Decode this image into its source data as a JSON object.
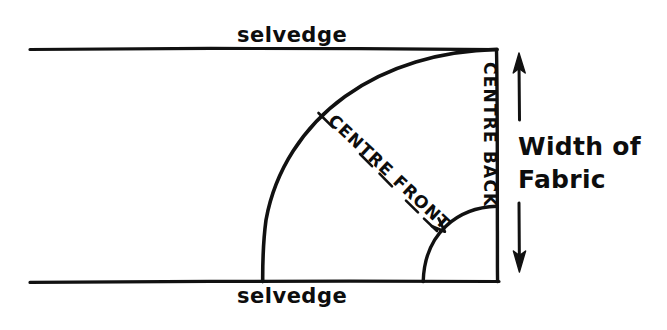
{
  "diagram": {
    "ink_color": "#111111",
    "background_color": "#ffffff",
    "labels": {
      "selvedge_top": "selvedge",
      "selvedge_bottom": "selvedge",
      "centre_back": "CENTRE BACK",
      "centre_front": "CENTRE FRONT",
      "width_of_fabric_line1": "Width of",
      "width_of_fabric_line2": "Fabric"
    },
    "geometry": {
      "fabric_rect": {
        "left": 30,
        "top": 48,
        "right": 497,
        "bottom": 281
      },
      "hem_arc": {
        "center_x": 497,
        "center_y": 281,
        "radius": 232
      },
      "waist_arc": {
        "center_x": 497,
        "center_y": 281,
        "radius": 75
      },
      "centre_front_line": {
        "x1": 318,
        "y1": 113,
        "x2": 445,
        "y2": 232
      },
      "width_arrow": {
        "x": 519,
        "y_top": 55,
        "y_bottom": 272
      }
    }
  }
}
